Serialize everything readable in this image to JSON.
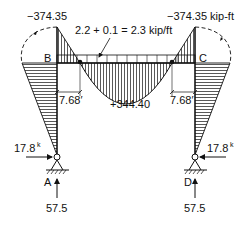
{
  "diagram": {
    "joints": {
      "B": "B",
      "C": "C",
      "A": "A",
      "D": "D"
    },
    "moments": {
      "left_negative": "−374.35",
      "right_negative": "−374.35 kip-ft",
      "midspan_positive": "+344.40"
    },
    "load_label": "2.2 + 0.1 = 2.3 kip/ft",
    "inflection_distances": {
      "left": "7.68′",
      "right": "7.68′"
    },
    "reactions": {
      "horizontal_left": "17.8",
      "horizontal_right": "17.8",
      "horizontal_unit_superscript": "k",
      "vertical_left": "57.5",
      "vertical_right": "57.5"
    },
    "colors": {
      "line": "#111111",
      "background": "#ffffff"
    }
  }
}
